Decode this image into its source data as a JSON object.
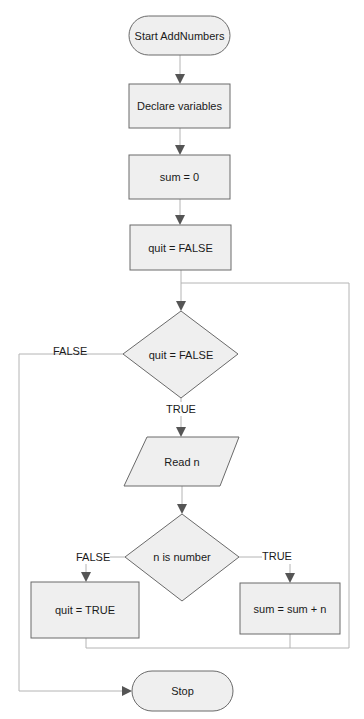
{
  "diagram": {
    "type": "flowchart",
    "nodes": {
      "start": {
        "shape": "terminal",
        "label": "Start AddNumbers"
      },
      "declare": {
        "shape": "process",
        "label": "Declare variables"
      },
      "sum_init": {
        "shape": "process",
        "label": "sum = 0"
      },
      "quit_init": {
        "shape": "process",
        "label": "quit = FALSE"
      },
      "decision_quit": {
        "shape": "decision",
        "label": "quit = FALSE"
      },
      "read_n": {
        "shape": "input-output",
        "label": "Read n"
      },
      "decision_number": {
        "shape": "decision",
        "label": "n is number"
      },
      "set_quit": {
        "shape": "process",
        "label": "quit = TRUE"
      },
      "add_sum": {
        "shape": "process",
        "label": "sum = sum + n"
      },
      "stop": {
        "shape": "terminal",
        "label": "Stop"
      }
    },
    "edges": {
      "quit_false": {
        "from": "decision_quit",
        "to": "stop",
        "label": "FALSE"
      },
      "quit_true": {
        "from": "decision_quit",
        "to": "read_n",
        "label": "TRUE"
      },
      "number_false": {
        "from": "decision_number",
        "to": "set_quit",
        "label": "FALSE"
      },
      "number_true": {
        "from": "decision_number",
        "to": "add_sum",
        "label": "TRUE"
      }
    },
    "colors": {
      "shape_fill": "#efefef",
      "shape_stroke": "#6a6a6a",
      "connector": "#b4b4b4",
      "arrowhead": "#555555",
      "text": "#1a1a1a"
    }
  }
}
